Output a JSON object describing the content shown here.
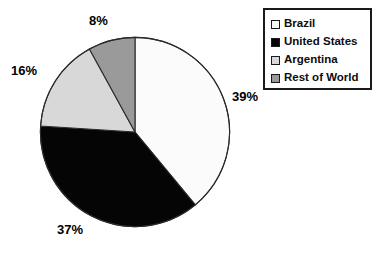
{
  "chart_data": {
    "type": "pie",
    "title": "",
    "labels": [
      "Brazil",
      "United States",
      "Argentina",
      "Rest of World"
    ],
    "values": [
      39,
      37,
      16,
      8
    ],
    "value_labels": [
      "39%",
      "37%",
      "16%",
      "8%"
    ],
    "units": "percent",
    "start_angle_deg": 0,
    "direction": "clockwise",
    "colors": [
      "#fbfbfb",
      "#050505",
      "#d8d8d8",
      "#9a9a9a"
    ],
    "slice_border_color": "#2b2b2b",
    "legend_position": "top-right",
    "legend_entries": [
      {
        "label": "Brazil",
        "color": "#fbfbfb"
      },
      {
        "label": "United States",
        "color": "#050505"
      },
      {
        "label": "Argentina",
        "color": "#d8d8d8"
      },
      {
        "label": "Rest of World",
        "color": "#9a9a9a"
      }
    ],
    "grid": false,
    "xlabel": "",
    "ylabel": ""
  },
  "pie": {
    "labels": {
      "brazil": "39%",
      "united_states": "37%",
      "argentina": "16%",
      "rest_of_world": "8%"
    }
  },
  "legend": {
    "items": [
      {
        "label": "Brazil"
      },
      {
        "label": "United States"
      },
      {
        "label": "Argentina"
      },
      {
        "label": "Rest of World"
      }
    ]
  }
}
